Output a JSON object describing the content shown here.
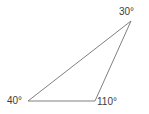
{
  "figure": {
    "background_color": "#ffffff",
    "stroke_color": "#808080",
    "text_color": "#3c3c3c",
    "width": 149,
    "height": 114
  },
  "labels": {
    "apex": {
      "value": "30",
      "degree_symbol": "°",
      "text": "30°",
      "name": "angle-label-apex"
    },
    "left": {
      "value": "40",
      "degree_symbol": "°",
      "text": "40°",
      "name": "angle-label-left"
    },
    "right": {
      "value": "110",
      "degree_symbol": "°",
      "text": "110°",
      "name": "angle-label-right"
    }
  },
  "chart_data": {
    "type": "diagram",
    "shape": "triangle",
    "vertices": [
      {
        "id": "apex",
        "x": 131,
        "y": 21,
        "angle": 30,
        "label": "30°"
      },
      {
        "id": "bottom_left",
        "x": 28,
        "y": 101,
        "angle": 40,
        "label": "40°"
      },
      {
        "id": "bottom_right",
        "x": 95,
        "y": 101,
        "angle": 110,
        "label": "110°"
      }
    ],
    "edges": [
      {
        "from": "bottom_left",
        "to": "apex"
      },
      {
        "from": "apex",
        "to": "bottom_right"
      },
      {
        "from": "bottom_right",
        "to": "bottom_left"
      }
    ],
    "angle_sum": 180,
    "stroke_width": 1,
    "stroke_color": "#808080",
    "fill": "none"
  }
}
